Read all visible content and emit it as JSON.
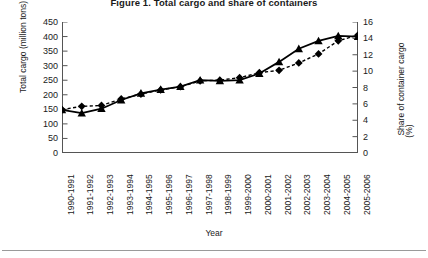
{
  "chart_data": {
    "type": "line",
    "title": "Figure 1.  Total cargo and share of containers",
    "xlabel": "Year",
    "ylabel": "Total cargo (million tons)",
    "y2label": "Share of container cargo",
    "y2label_unit": "(%)",
    "categories": [
      "1990-1991",
      "1991-1992",
      "1992-1993",
      "1993-1994",
      "1994-1995",
      "1995-1996",
      "1996-1997",
      "1997-1998",
      "1998-1999",
      "1999-2000",
      "2000-2001",
      "2001-2002",
      "2002-2003",
      "2003-2004",
      "2004-2005",
      "2005-2006"
    ],
    "ylim": [
      0,
      450
    ],
    "yticks": [
      0,
      50,
      100,
      150,
      200,
      250,
      300,
      350,
      400,
      450
    ],
    "y2lim": [
      0,
      16
    ],
    "y2ticks": [
      0,
      2,
      4,
      6,
      8,
      10,
      12,
      14,
      16
    ],
    "grid": false,
    "legend": "none",
    "series": [
      {
        "name": "Total cargo (million tons)",
        "axis": "left",
        "marker": "triangle",
        "line_style": "solid",
        "color": "#000000",
        "values": [
          148,
          137,
          152,
          182,
          205,
          218,
          228,
          250,
          248,
          250,
          273,
          313,
          358,
          385,
          402,
          400
        ]
      },
      {
        "name": "Share of container cargo (%)",
        "axis": "right",
        "marker": "diamond",
        "line_style": "dashed",
        "color": "#000000",
        "values": [
          5.3,
          5.7,
          5.8,
          6.6,
          7.2,
          7.7,
          8.1,
          8.8,
          8.9,
          9.2,
          9.8,
          10.1,
          11.0,
          12.1,
          13.7,
          14.4
        ]
      }
    ]
  }
}
